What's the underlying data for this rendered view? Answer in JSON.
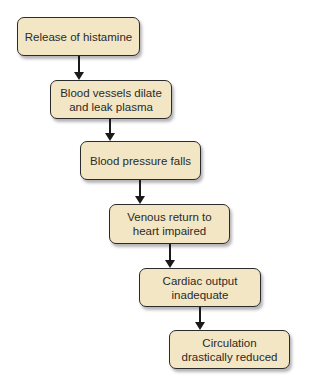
{
  "diagram": {
    "type": "flowchart",
    "direction": "top-to-bottom staircase",
    "colors": {
      "box_fill": "#f3e6c4",
      "box_border": "#2b2b2b",
      "arrow": "#1a1a1a",
      "text": "#2a2a2a"
    },
    "nodes": [
      {
        "id": "n1",
        "label": "Release of histamine"
      },
      {
        "id": "n2",
        "label": "Blood vessels dilate\nand leak plasma"
      },
      {
        "id": "n3",
        "label": "Blood pressure falls"
      },
      {
        "id": "n4",
        "label": "Venous return to\nheart impaired"
      },
      {
        "id": "n5",
        "label": "Cardiac output\ninadequate"
      },
      {
        "id": "n6",
        "label": "Circulation\ndrastically reduced"
      }
    ],
    "edges": [
      {
        "from": "n1",
        "to": "n2"
      },
      {
        "from": "n2",
        "to": "n3"
      },
      {
        "from": "n3",
        "to": "n4"
      },
      {
        "from": "n4",
        "to": "n5"
      },
      {
        "from": "n5",
        "to": "n6"
      }
    ]
  }
}
